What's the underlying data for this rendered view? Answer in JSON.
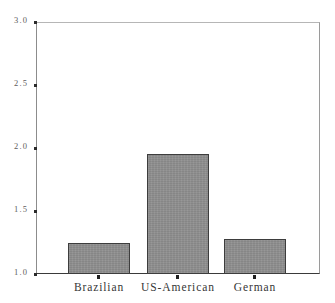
{
  "chart_data": {
    "type": "bar",
    "title": "",
    "subtitle": "",
    "xlabel": "",
    "ylabel": "",
    "categories": [
      "Brazilian",
      "US-American",
      "German"
    ],
    "values": [
      1.25,
      1.95,
      1.28
    ],
    "series": [
      {
        "name": "",
        "values": [
          1.25,
          1.95,
          1.28
        ]
      }
    ],
    "ylim": [
      1.0,
      3.0
    ],
    "ytick_labels": [
      "1.0",
      "1.5",
      "2.0",
      "2.5",
      "3.0"
    ],
    "ytick_values": [
      1.0,
      1.5,
      2.0,
      2.5,
      3.0
    ],
    "grid": false,
    "legend": false,
    "legend_position": "none",
    "bar_color": "#8d8d8d",
    "bar_edge_color": "#3d3d3d",
    "axis_color": "#2b2b2b",
    "background_color": "#ffffff",
    "annotations": []
  },
  "axes": {
    "y": {
      "ticks": [
        {
          "label": "3.0",
          "value": 3.0
        },
        {
          "label": "2.5",
          "value": 2.5
        },
        {
          "label": "2.0",
          "value": 2.0
        },
        {
          "label": "1.5",
          "value": 1.5
        },
        {
          "label": "1.0",
          "value": 1.0
        }
      ]
    },
    "x": {
      "ticks": [
        {
          "label": "Brazilian"
        },
        {
          "label": "US-American"
        },
        {
          "label": "German"
        }
      ]
    }
  }
}
